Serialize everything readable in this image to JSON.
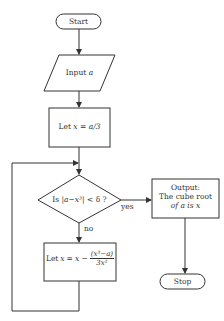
{
  "diagram": {
    "type": "flowchart",
    "colors": {
      "stroke": "#333333",
      "text": "#333333",
      "background": "#ffffff"
    },
    "nodes": {
      "start": {
        "shape": "terminal",
        "label": "Start"
      },
      "input": {
        "shape": "parallelogram",
        "label_prefix": "Input",
        "label_var": "a"
      },
      "init": {
        "shape": "rectangle",
        "label": "Let x = a/3",
        "parts": {
          "let": "Let",
          "x": "x",
          "eq": "=",
          "expr": "a/3"
        }
      },
      "decision": {
        "shape": "diamond",
        "label": "Is |a−x³| < δ ?",
        "parts": {
          "is": "Is",
          "abs": "|a−x³|",
          "lt": "<",
          "delta": "δ",
          "q": "?"
        }
      },
      "update": {
        "shape": "rectangle",
        "label": "Let x = x − (x³−a)/(3x²)",
        "parts": {
          "let": "Let",
          "x": "x",
          "eq": "=",
          "lhs": "x −",
          "num": "(x³−a)",
          "den": "3x²"
        }
      },
      "output": {
        "shape": "rectangle",
        "lines": [
          "Output:",
          "The cube root",
          "of a is x"
        ]
      },
      "stop": {
        "shape": "terminal",
        "label": "Stop"
      }
    },
    "edges": [
      {
        "from": "start",
        "to": "input",
        "label": ""
      },
      {
        "from": "input",
        "to": "init",
        "label": ""
      },
      {
        "from": "init",
        "to": "decision",
        "label": ""
      },
      {
        "from": "decision",
        "to": "output",
        "label": "yes"
      },
      {
        "from": "decision",
        "to": "update",
        "label": "no"
      },
      {
        "from": "update",
        "to": "decision",
        "label": ""
      },
      {
        "from": "output",
        "to": "stop",
        "label": ""
      }
    ],
    "edge_labels": {
      "yes": "yes",
      "no": "no"
    }
  }
}
